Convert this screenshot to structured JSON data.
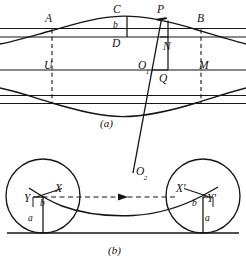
{
  "figure": {
    "colors": {
      "ink": "#111111",
      "line": "#1a1a1a",
      "background": "#ffffff",
      "dashed": "#333333"
    },
    "panels": [
      {
        "id": "panel-a",
        "caption": "(a)",
        "caption_pos": {
          "x": 100,
          "y": 118
        },
        "point_labels": [
          {
            "name": "A",
            "text": "A",
            "x": 45,
            "y": 13
          },
          {
            "name": "C",
            "text": "C",
            "x": 113,
            "y": 4
          },
          {
            "name": "P",
            "text": "P",
            "x": 157,
            "y": 4
          },
          {
            "name": "B",
            "text": "B",
            "x": 197,
            "y": 13
          },
          {
            "name": "D",
            "text": "D",
            "x": 112,
            "y": 38
          },
          {
            "name": "N",
            "text": "N",
            "x": 163,
            "y": 41
          },
          {
            "name": "U",
            "text": "U",
            "x": 44,
            "y": 60
          },
          {
            "name": "M",
            "text": "M",
            "x": 199,
            "y": 60
          },
          {
            "name": "Q",
            "text": "Q",
            "x": 159,
            "y": 73
          }
        ],
        "subscript_labels": [
          {
            "name": "O1",
            "base": "O",
            "sub": "1",
            "x": 138,
            "y": 60
          }
        ],
        "segment_labels": [
          {
            "name": "b",
            "text": "b",
            "x": 113,
            "y": 21
          }
        ]
      },
      {
        "id": "panel-b",
        "caption": "(b)",
        "caption_pos": {
          "x": 108,
          "y": 245
        },
        "point_labels": [
          {
            "name": "X",
            "text": "X",
            "x": 55,
            "y": 183
          },
          {
            "name": "Y",
            "text": "Y",
            "x": 24,
            "y": 193
          },
          {
            "name": "X-prime",
            "text": "X′",
            "x": 176,
            "y": 183
          },
          {
            "name": "Y-prime",
            "text": "Y′",
            "x": 207,
            "y": 193
          }
        ],
        "subscript_labels": [
          {
            "name": "O2",
            "base": "O",
            "sub": "2",
            "x": 136,
            "y": 166
          }
        ],
        "segment_labels": [
          {
            "name": "b-left",
            "text": "b",
            "x": 40,
            "y": 199
          },
          {
            "name": "a-left",
            "text": "a",
            "x": 28,
            "y": 214
          },
          {
            "name": "b-right",
            "text": "b",
            "x": 192,
            "y": 199
          },
          {
            "name": "a-right",
            "text": "a",
            "x": 205,
            "y": 214
          }
        ]
      }
    ],
    "geometry": {
      "panel_a": {
        "h_lines_y": [
          28.5,
          37.0,
          70.0,
          95.5,
          103.5
        ],
        "curve_top_peak_y": 16,
        "curve_bottom_trough_y": 116,
        "rect_left_x": 52,
        "rect_right_x": 201,
        "rect_top_y": 28.5,
        "rect_bottom_y": 103.5,
        "vertical_CD_x": 127,
        "vertical_PQ_x": 168,
        "slant_top": {
          "x": 161,
          "y": 19
        },
        "slant_bottom": {
          "x": 133,
          "y": 172
        }
      },
      "panel_b": {
        "baseline_y": 233,
        "circle_left": {
          "cx": 43,
          "cy": 196,
          "r": 37
        },
        "circle_right": {
          "cx": 203,
          "cy": 196,
          "r": 37
        },
        "dash_axis_y": 197,
        "O2": {
          "x": 133,
          "y": 172
        }
      }
    }
  }
}
